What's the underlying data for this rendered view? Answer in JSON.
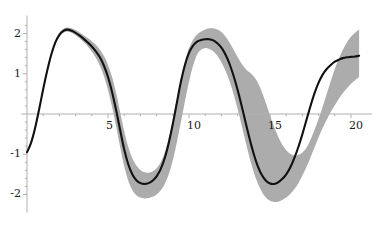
{
  "chart_data": {
    "type": "line",
    "title": "",
    "subtitle": "",
    "xlabel": "",
    "ylabel": "",
    "xlim": [
      -0.35,
      21.3
    ],
    "ylim": [
      -2.45,
      2.45
    ],
    "grid": false,
    "legend": null,
    "axis_color": "#b0b0b0",
    "line_color": "#111111",
    "band_color": "#9e9e9e",
    "band_opacity": 0.85,
    "x_ticks": [
      5,
      10,
      15,
      20
    ],
    "x_tick_labels": [
      "5",
      "10",
      "15",
      "20"
    ],
    "y_ticks": [
      -2,
      -1,
      1,
      2
    ],
    "y_tick_labels": [
      "-2",
      "-1",
      "1",
      "2"
    ],
    "x_minor_ticks": [
      1,
      2,
      3,
      4,
      6,
      7,
      8,
      9,
      11,
      12,
      13,
      14,
      16,
      17,
      18,
      19
    ],
    "y_minor_ticks": [
      -2.0,
      -1.8,
      -1.6,
      -1.4,
      -1.2,
      -0.8,
      -0.6,
      -0.4,
      -0.2,
      0.2,
      0.4,
      0.6,
      0.8,
      1.2,
      1.4,
      1.6,
      1.8,
      2.2
    ],
    "series": [
      {
        "name": "mean",
        "x": [
          0.0,
          0.25,
          0.5,
          0.75,
          1.0,
          1.25,
          1.5,
          1.75,
          2.0,
          2.25,
          2.5,
          2.75,
          3.0,
          3.25,
          3.5,
          3.75,
          4.0,
          4.25,
          4.5,
          4.75,
          5.0,
          5.25,
          5.5,
          5.75,
          6.0,
          6.25,
          6.5,
          6.75,
          7.0,
          7.25,
          7.5,
          7.75,
          8.0,
          8.25,
          8.5,
          8.75,
          9.0,
          9.25,
          9.5,
          9.75,
          10.0,
          10.25,
          10.5,
          10.75,
          11.0,
          11.25,
          11.5,
          11.75,
          12.0,
          12.25,
          12.5,
          12.75,
          13.0,
          13.25,
          13.5,
          13.75,
          14.0,
          14.25,
          14.5,
          14.75,
          15.0,
          15.25,
          15.5,
          15.75,
          16.0,
          16.25,
          16.5,
          16.75,
          17.0,
          17.25,
          17.5,
          17.75,
          18.0,
          18.25,
          18.5,
          18.75,
          19.0,
          19.25,
          19.5,
          19.75,
          20.0,
          20.25,
          20.5
        ],
        "y": [
          -0.95,
          -0.72,
          -0.35,
          0.12,
          0.62,
          1.08,
          1.48,
          1.78,
          1.97,
          2.07,
          2.1,
          2.07,
          2.02,
          1.95,
          1.87,
          1.78,
          1.68,
          1.56,
          1.41,
          1.2,
          0.92,
          0.55,
          0.1,
          -0.4,
          -0.88,
          -1.25,
          -1.5,
          -1.65,
          -1.72,
          -1.74,
          -1.72,
          -1.66,
          -1.55,
          -1.37,
          -1.1,
          -0.72,
          -0.25,
          0.28,
          0.8,
          1.22,
          1.52,
          1.7,
          1.8,
          1.84,
          1.86,
          1.86,
          1.83,
          1.76,
          1.65,
          1.48,
          1.25,
          0.95,
          0.6,
          0.2,
          -0.22,
          -0.63,
          -1.0,
          -1.3,
          -1.52,
          -1.66,
          -1.73,
          -1.74,
          -1.7,
          -1.62,
          -1.5,
          -1.33,
          -1.1,
          -0.82,
          -0.5,
          -0.15,
          0.2,
          0.52,
          0.78,
          0.98,
          1.12,
          1.22,
          1.3,
          1.35,
          1.39,
          1.41,
          1.42,
          1.43,
          1.45
        ]
      },
      {
        "name": "upper_band",
        "x": [
          0.0,
          0.25,
          0.5,
          0.75,
          1.0,
          1.25,
          1.5,
          1.75,
          2.0,
          2.25,
          2.5,
          2.75,
          3.0,
          3.25,
          3.5,
          3.75,
          4.0,
          4.25,
          4.5,
          4.75,
          5.0,
          5.25,
          5.5,
          5.75,
          6.0,
          6.25,
          6.5,
          6.75,
          7.0,
          7.25,
          7.5,
          7.75,
          8.0,
          8.25,
          8.5,
          8.75,
          9.0,
          9.25,
          9.5,
          9.75,
          10.0,
          10.25,
          10.5,
          10.75,
          11.0,
          11.25,
          11.5,
          11.75,
          12.0,
          12.25,
          12.5,
          12.75,
          13.0,
          13.25,
          13.5,
          13.75,
          14.0,
          14.25,
          14.5,
          14.75,
          15.0,
          15.25,
          15.5,
          15.75,
          16.0,
          16.25,
          16.5,
          16.75,
          17.0,
          17.25,
          17.5,
          17.75,
          18.0,
          18.25,
          18.5,
          18.75,
          19.0,
          19.25,
          19.5,
          19.75,
          20.0,
          20.25,
          20.5
        ],
        "y": [
          -0.92,
          -0.68,
          -0.3,
          0.17,
          0.67,
          1.13,
          1.53,
          1.83,
          2.02,
          2.12,
          2.15,
          2.13,
          2.09,
          2.03,
          1.96,
          1.89,
          1.81,
          1.72,
          1.6,
          1.44,
          1.22,
          0.92,
          0.53,
          0.05,
          -0.43,
          -0.82,
          -1.1,
          -1.28,
          -1.39,
          -1.45,
          -1.46,
          -1.43,
          -1.35,
          -1.2,
          -0.96,
          -0.6,
          -0.15,
          0.38,
          0.9,
          1.32,
          1.64,
          1.85,
          1.98,
          2.05,
          2.1,
          2.13,
          2.13,
          2.1,
          2.04,
          1.93,
          1.78,
          1.6,
          1.42,
          1.25,
          1.12,
          1.03,
          0.93,
          0.78,
          0.55,
          0.27,
          -0.03,
          -0.32,
          -0.56,
          -0.76,
          -0.9,
          -0.99,
          -1.03,
          -1.02,
          -0.96,
          -0.84,
          -0.64,
          -0.4,
          -0.12,
          0.18,
          0.5,
          0.82,
          1.12,
          1.38,
          1.6,
          1.78,
          1.92,
          2.02,
          2.1
        ]
      },
      {
        "name": "lower_band",
        "x": [
          0.0,
          0.25,
          0.5,
          0.75,
          1.0,
          1.25,
          1.5,
          1.75,
          2.0,
          2.25,
          2.5,
          2.75,
          3.0,
          3.25,
          3.5,
          3.75,
          4.0,
          4.25,
          4.5,
          4.75,
          5.0,
          5.25,
          5.5,
          5.75,
          6.0,
          6.25,
          6.5,
          6.75,
          7.0,
          7.25,
          7.5,
          7.75,
          8.0,
          8.25,
          8.5,
          8.75,
          9.0,
          9.25,
          9.5,
          9.75,
          10.0,
          10.25,
          10.5,
          10.75,
          11.0,
          11.25,
          11.5,
          11.75,
          12.0,
          12.25,
          12.5,
          12.75,
          13.0,
          13.25,
          13.5,
          13.75,
          14.0,
          14.25,
          14.5,
          14.75,
          15.0,
          15.25,
          15.5,
          15.75,
          16.0,
          16.25,
          16.5,
          16.75,
          17.0,
          17.25,
          17.5,
          17.75,
          18.0,
          18.25,
          18.5,
          18.75,
          19.0,
          19.25,
          19.5,
          19.75,
          20.0,
          20.25,
          20.5
        ],
        "y": [
          -0.98,
          -0.76,
          -0.4,
          0.07,
          0.57,
          1.03,
          1.43,
          1.73,
          1.92,
          2.02,
          2.05,
          2.02,
          1.96,
          1.88,
          1.79,
          1.68,
          1.55,
          1.4,
          1.2,
          0.94,
          0.6,
          0.18,
          -0.3,
          -0.82,
          -1.3,
          -1.66,
          -1.89,
          -2.02,
          -2.08,
          -2.1,
          -2.09,
          -2.06,
          -2.0,
          -1.9,
          -1.74,
          -1.5,
          -1.15,
          -0.7,
          -0.2,
          0.32,
          0.8,
          1.2,
          1.48,
          1.6,
          1.64,
          1.62,
          1.56,
          1.45,
          1.29,
          1.08,
          0.82,
          0.5,
          0.13,
          -0.28,
          -0.7,
          -1.1,
          -1.45,
          -1.73,
          -1.94,
          -2.08,
          -2.16,
          -2.19,
          -2.18,
          -2.14,
          -2.08,
          -1.99,
          -1.87,
          -1.72,
          -1.53,
          -1.32,
          -1.08,
          -0.83,
          -0.58,
          -0.35,
          -0.14,
          0.05,
          0.22,
          0.38,
          0.52,
          0.64,
          0.75,
          0.84,
          0.92
        ]
      }
    ],
    "annotations": []
  },
  "axis": {
    "x_axis_name": "horizontal-axis",
    "y_axis_name": "vertical-axis"
  }
}
